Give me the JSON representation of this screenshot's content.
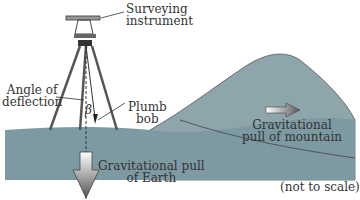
{
  "diagram": {
    "labels": {
      "instrument_l1": "Surveying",
      "instrument_l2": "instrument",
      "angle_l1": "Angle of",
      "angle_l2": "deflection",
      "beta": "β",
      "plumb_l1": "Plumb",
      "plumb_l2": "bob",
      "earth_l1": "Gravitational pull",
      "earth_l2": "of Earth",
      "mountain_l1": "Gravitational",
      "mountain_l2": "pull of mountain",
      "note": "(not to scale)"
    },
    "colors": {
      "ground": "#7d9aa3",
      "mountain": "#8fa5ac",
      "text": "#333333"
    }
  }
}
